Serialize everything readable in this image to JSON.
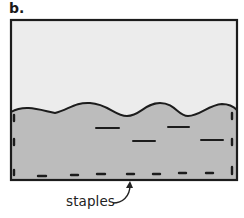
{
  "panel": {
    "label": "b."
  },
  "diagram": {
    "colors": {
      "outline": "#1c1c1c",
      "upper_fill": "#ececec",
      "lower_fill": "#bcbcbc",
      "mark": "#1c1c1c"
    },
    "callout": {
      "label": "staples"
    }
  }
}
